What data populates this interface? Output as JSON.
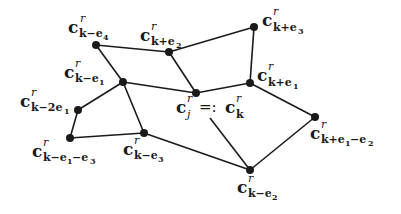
{
  "diagram": {
    "type": "graph",
    "nodes": [
      {
        "id": "k-e4",
        "x": 96,
        "y": 45,
        "label": {
          "base": "c",
          "sup": "r",
          "sub": "k−e₄"
        }
      },
      {
        "id": "k+e2",
        "x": 169,
        "y": 52,
        "label": {
          "base": "c",
          "sup": "r",
          "sub": "k+e₂"
        }
      },
      {
        "id": "k+e3",
        "x": 254,
        "y": 27,
        "label": {
          "base": "c",
          "sup": "r",
          "sub": "k+e₃"
        }
      },
      {
        "id": "k-e1",
        "x": 123,
        "y": 82,
        "label": {
          "base": "c",
          "sup": "r",
          "sub": "k−e₁"
        }
      },
      {
        "id": "k",
        "x": 196,
        "y": 93,
        "label": {
          "base": "c",
          "sup": "r",
          "sub": "j",
          "eq": "=:",
          "base2": "c",
          "sup2": "r",
          "sub2": "k"
        }
      },
      {
        "id": "k+e1",
        "x": 250,
        "y": 83,
        "label": {
          "base": "c",
          "sup": "r",
          "sub": "k+e₁"
        }
      },
      {
        "id": "k-2e1",
        "x": 78,
        "y": 110,
        "label": {
          "base": "c",
          "sup": "r",
          "sub": "k−2e₁"
        }
      },
      {
        "id": "k-e1-e3",
        "x": 70,
        "y": 138,
        "label": {
          "base": "c",
          "sup": "r",
          "sub": "k−e₁−e₃"
        }
      },
      {
        "id": "k-e3",
        "x": 144,
        "y": 133,
        "label": {
          "base": "c",
          "sup": "r",
          "sub": "k−e₃"
        }
      },
      {
        "id": "k+e1-e2",
        "x": 315,
        "y": 117,
        "label": {
          "base": "c",
          "sup": "r",
          "sub": "k+e₁−e₂"
        }
      },
      {
        "id": "k-e2",
        "x": 250,
        "y": 170,
        "label": {
          "base": "c",
          "sup": "r",
          "sub": "k−e₂"
        }
      }
    ],
    "edges": [
      [
        "k-e4",
        "k+e2"
      ],
      [
        "k+e2",
        "k+e3"
      ],
      [
        "k+e2",
        "k"
      ],
      [
        "k+e3",
        "k+e1"
      ],
      [
        "k-e4",
        "k-e1"
      ],
      [
        "k-e1",
        "k"
      ],
      [
        "k",
        "k+e1"
      ],
      [
        "k+e1",
        "k+e1-e2"
      ],
      [
        "k+e1-e2",
        "k-e2"
      ],
      [
        "k-e1",
        "k-2e1"
      ],
      [
        "k-2e1",
        "k-e1-e3"
      ],
      [
        "k-e1-e3",
        "k-e3"
      ],
      [
        "k-e3",
        "k-e1"
      ],
      [
        "k-e3",
        "k-e2"
      ]
    ],
    "pointer_line": {
      "from": {
        "x": 210,
        "y": 118
      },
      "to": "k-e2"
    },
    "labels": {
      "k-e4": {
        "c": "c",
        "r": "r",
        "sub": "k−e",
        "idx": "4"
      },
      "k+e2": {
        "c": "c",
        "r": "r",
        "sub": "k+e",
        "idx": "2"
      },
      "k+e3": {
        "c": "c",
        "r": "r",
        "sub": "k+e",
        "idx": "3"
      },
      "k-e1": {
        "c": "c",
        "r": "r",
        "sub": "k−e",
        "idx": "1"
      },
      "k+e1": {
        "c": "c",
        "r": "r",
        "sub": "k+e",
        "idx": "1"
      },
      "k-2e1": {
        "c": "c",
        "r": "r",
        "sub": "k−2e",
        "idx": "1"
      },
      "k-e1-e3": {
        "c": "c",
        "r": "r",
        "sub": "k−e",
        "idx": "1",
        "sub2": "−e",
        "idx2": "3"
      },
      "k-e3": {
        "c": "c",
        "r": "r",
        "sub": "k−e",
        "idx": "3"
      },
      "k+e1-e2": {
        "c": "c",
        "r": "r",
        "sub": "k+e",
        "idx": "1",
        "sub2": "−e",
        "idx2": "2"
      },
      "k-e2": {
        "c": "c",
        "r": "r",
        "sub": "k−e",
        "idx": "2"
      },
      "center": {
        "c": "c",
        "r": "r",
        "j": "j",
        "eq": "=:",
        "c2": "c",
        "r2": "r",
        "k": "k"
      }
    }
  }
}
